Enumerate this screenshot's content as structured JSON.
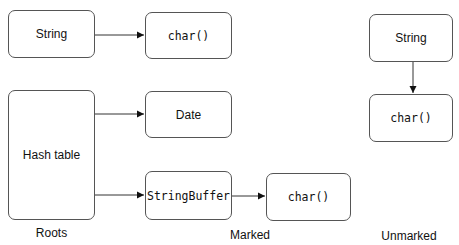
{
  "diagram": {
    "type": "object-reachability-mark-phase",
    "groups": {
      "roots": {
        "label": "Roots"
      },
      "marked": {
        "label": "Marked"
      },
      "unmarked": {
        "label": "Unmarked"
      }
    },
    "nodes": {
      "root_string": {
        "label": "String",
        "group": "roots",
        "font": "sans"
      },
      "hash_table": {
        "label": "Hash table",
        "group": "roots",
        "font": "sans"
      },
      "marked_char_1": {
        "label": "char()",
        "group": "marked",
        "font": "mono"
      },
      "marked_date": {
        "label": "Date",
        "group": "marked",
        "font": "sans"
      },
      "marked_stringbuffer": {
        "label": "StringBuffer",
        "group": "marked",
        "font": "mono"
      },
      "marked_char_2": {
        "label": "char()",
        "group": "marked",
        "font": "mono"
      },
      "unmarked_string": {
        "label": "String",
        "group": "unmarked",
        "font": "sans"
      },
      "unmarked_char": {
        "label": "char()",
        "group": "unmarked",
        "font": "mono"
      }
    },
    "edges": [
      {
        "from": "root_string",
        "to": "marked_char_1"
      },
      {
        "from": "hash_table",
        "to": "marked_date"
      },
      {
        "from": "hash_table",
        "to": "marked_stringbuffer"
      },
      {
        "from": "marked_stringbuffer",
        "to": "marked_char_2"
      },
      {
        "from": "unmarked_string",
        "to": "unmarked_char"
      }
    ],
    "colors": {
      "stroke": "#555555",
      "text": "#111111",
      "background": "#ffffff"
    }
  }
}
